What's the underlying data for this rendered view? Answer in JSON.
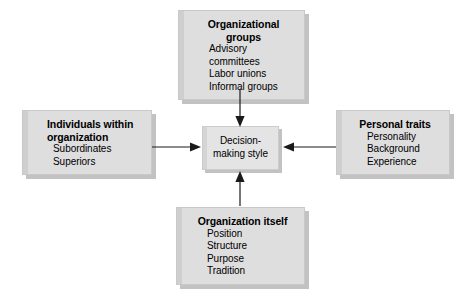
{
  "diagram": {
    "center": {
      "label": "Decision-\nmaking style",
      "name": "decision-making-style"
    },
    "nodes": [
      {
        "id": "organizational-groups",
        "heading": "Organizational groups",
        "items": [
          "Advisory committees",
          "Labor unions",
          "Informal groups"
        ],
        "position": "top"
      },
      {
        "id": "individuals-within-organization",
        "heading": "Individuals within\n   organization",
        "items": [
          "Subordinates",
          "Superiors"
        ],
        "position": "left"
      },
      {
        "id": "personal-traits",
        "heading": "Personal traits",
        "items": [
          "Personality",
          "Background",
          "Experience"
        ],
        "position": "right"
      },
      {
        "id": "organization-itself",
        "heading": "Organization itself",
        "items": [
          "Position",
          "Structure",
          "Purpose",
          "Tradition"
        ],
        "position": "bottom"
      }
    ],
    "arrows": [
      {
        "from": "organizational-groups",
        "to": "decision-making-style",
        "direction": "down"
      },
      {
        "from": "individuals-within-organization",
        "to": "decision-making-style",
        "direction": "right"
      },
      {
        "from": "personal-traits",
        "to": "decision-making-style",
        "direction": "left"
      },
      {
        "from": "organization-itself",
        "to": "decision-making-style",
        "direction": "up"
      }
    ],
    "colors": {
      "box_fill": "#dedede",
      "center_fill": "#e4e4e4",
      "shadow": "#c2c2c2",
      "line": "#1a1a1a",
      "text": "#000000",
      "background": "#ffffff"
    }
  }
}
